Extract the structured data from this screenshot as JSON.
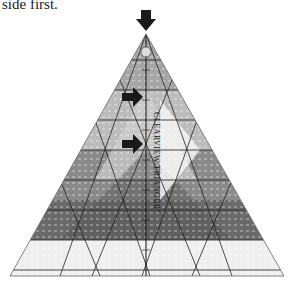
{
  "caption": "side first.",
  "ruler": {
    "brand_label": "CLEARVIEW TRIANGLE",
    "size_label": "10\"",
    "arrows": [
      {
        "name": "top-arrow",
        "direction": "down"
      },
      {
        "name": "upper-arrow",
        "direction": "right"
      },
      {
        "name": "middle-arrow",
        "direction": "right"
      }
    ],
    "colors": {
      "light_band": "#bdbdbd",
      "mid_band": "#8c8c8c",
      "dark_band": "#5e5e5e",
      "white_band": "#f2f2f2",
      "arrow": "#1a1a1a"
    }
  }
}
